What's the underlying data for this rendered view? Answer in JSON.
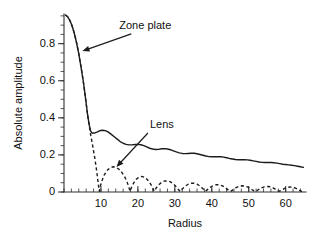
{
  "chart_data": {
    "type": "line",
    "title": "",
    "xlabel": "Radius",
    "ylabel": "Absolute amplitude",
    "xlim": [
      0,
      65.5
    ],
    "ylim": [
      0,
      0.96
    ],
    "grid": false,
    "legend": "annotations on plot",
    "x_ticks": [
      10,
      20,
      30,
      40,
      50,
      60
    ],
    "x_tick_labels": [
      "10",
      "20",
      "30",
      "40",
      "50",
      "60"
    ],
    "x_minor_tick_step": 2,
    "y_ticks": [
      0,
      0.2,
      0.4,
      0.6,
      0.8
    ],
    "y_tick_labels": [
      "0",
      "0.2",
      "0.4",
      "0.6",
      "0.8"
    ],
    "y_minor_tick_step": 0.05,
    "annotations": [
      {
        "text": "Zone plate",
        "x": 22.0,
        "y": 0.88,
        "arrow_to_x": 5.0,
        "arrow_to_y": 0.76
      },
      {
        "text": "Lens",
        "x": 26.5,
        "y": 0.345,
        "arrow_to_x": 14.2,
        "arrow_to_y": 0.135
      }
    ],
    "series": [
      {
        "name": "Zone plate",
        "style": "solid",
        "points": [
          [
            0.4,
            0.955
          ],
          [
            1.0,
            0.945
          ],
          [
            1.6,
            0.925
          ],
          [
            2.2,
            0.895
          ],
          [
            2.8,
            0.855
          ],
          [
            3.4,
            0.805
          ],
          [
            4.0,
            0.745
          ],
          [
            4.6,
            0.675
          ],
          [
            5.2,
            0.6
          ],
          [
            5.8,
            0.51
          ],
          [
            6.3,
            0.43
          ],
          [
            6.8,
            0.365
          ],
          [
            7.2,
            0.33
          ],
          [
            7.6,
            0.318
          ],
          [
            8.2,
            0.318
          ],
          [
            8.9,
            0.323
          ],
          [
            9.6,
            0.33
          ],
          [
            10.4,
            0.333
          ],
          [
            11.2,
            0.331
          ],
          [
            12.0,
            0.323
          ],
          [
            12.8,
            0.311
          ],
          [
            13.6,
            0.298
          ],
          [
            14.4,
            0.285
          ],
          [
            15.2,
            0.272
          ],
          [
            16.0,
            0.263
          ],
          [
            16.8,
            0.257
          ],
          [
            17.6,
            0.254
          ],
          [
            18.4,
            0.254
          ],
          [
            19.2,
            0.256
          ],
          [
            20.0,
            0.257
          ],
          [
            20.8,
            0.255
          ],
          [
            21.6,
            0.25
          ],
          [
            22.4,
            0.243
          ],
          [
            23.2,
            0.236
          ],
          [
            24.0,
            0.232
          ],
          [
            24.8,
            0.229
          ],
          [
            25.6,
            0.23
          ],
          [
            26.4,
            0.233
          ],
          [
            27.2,
            0.234
          ],
          [
            28.0,
            0.232
          ],
          [
            28.8,
            0.228
          ],
          [
            29.6,
            0.222
          ],
          [
            30.4,
            0.216
          ],
          [
            31.2,
            0.211
          ],
          [
            32.0,
            0.208
          ],
          [
            32.8,
            0.207
          ],
          [
            33.6,
            0.208
          ],
          [
            34.4,
            0.209
          ],
          [
            35.2,
            0.209
          ],
          [
            36.0,
            0.206
          ],
          [
            36.8,
            0.202
          ],
          [
            37.6,
            0.198
          ],
          [
            38.4,
            0.194
          ],
          [
            39.2,
            0.191
          ],
          [
            40.0,
            0.19
          ],
          [
            40.8,
            0.19
          ],
          [
            41.6,
            0.191
          ],
          [
            42.4,
            0.19
          ],
          [
            43.2,
            0.188
          ],
          [
            44.0,
            0.185
          ],
          [
            44.8,
            0.181
          ],
          [
            45.6,
            0.178
          ],
          [
            46.4,
            0.175
          ],
          [
            47.2,
            0.174
          ],
          [
            48.0,
            0.174
          ],
          [
            48.8,
            0.174
          ],
          [
            49.6,
            0.173
          ],
          [
            50.4,
            0.171
          ],
          [
            51.2,
            0.168
          ],
          [
            52.0,
            0.165
          ],
          [
            52.8,
            0.162
          ],
          [
            53.6,
            0.16
          ],
          [
            54.4,
            0.159
          ],
          [
            55.2,
            0.159
          ],
          [
            56.0,
            0.159
          ],
          [
            56.8,
            0.158
          ],
          [
            57.6,
            0.156
          ],
          [
            58.4,
            0.153
          ],
          [
            59.2,
            0.15
          ],
          [
            60.0,
            0.148
          ],
          [
            60.8,
            0.146
          ],
          [
            61.6,
            0.144
          ],
          [
            62.4,
            0.142
          ],
          [
            63.2,
            0.139
          ],
          [
            64.0,
            0.136
          ],
          [
            64.8,
            0.133
          ]
        ]
      },
      {
        "name": "Lens",
        "style": "dashed",
        "points": [
          [
            0.4,
            0.955
          ],
          [
            1.0,
            0.945
          ],
          [
            1.6,
            0.925
          ],
          [
            2.2,
            0.895
          ],
          [
            2.8,
            0.855
          ],
          [
            3.4,
            0.805
          ],
          [
            4.0,
            0.745
          ],
          [
            4.6,
            0.675
          ],
          [
            5.2,
            0.6
          ],
          [
            5.8,
            0.51
          ],
          [
            6.3,
            0.43
          ],
          [
            6.8,
            0.36
          ],
          [
            7.2,
            0.31
          ],
          [
            7.8,
            0.245
          ],
          [
            8.4,
            0.175
          ],
          [
            8.9,
            0.105
          ],
          [
            9.3,
            0.04
          ],
          [
            9.55,
            0.004
          ],
          [
            9.8,
            0.03
          ],
          [
            10.3,
            0.062
          ],
          [
            10.9,
            0.092
          ],
          [
            11.6,
            0.115
          ],
          [
            12.4,
            0.13
          ],
          [
            13.2,
            0.136
          ],
          [
            14.0,
            0.134
          ],
          [
            14.8,
            0.124
          ],
          [
            15.6,
            0.107
          ],
          [
            16.4,
            0.083
          ],
          [
            17.0,
            0.058
          ],
          [
            17.5,
            0.03
          ],
          [
            17.85,
            0.004
          ],
          [
            18.2,
            0.022
          ],
          [
            18.8,
            0.047
          ],
          [
            19.5,
            0.068
          ],
          [
            20.3,
            0.08
          ],
          [
            21.0,
            0.084
          ],
          [
            21.8,
            0.08
          ],
          [
            22.5,
            0.068
          ],
          [
            23.2,
            0.05
          ],
          [
            23.9,
            0.028
          ],
          [
            24.4,
            0.004
          ],
          [
            24.9,
            0.02
          ],
          [
            25.6,
            0.038
          ],
          [
            26.4,
            0.052
          ],
          [
            27.2,
            0.059
          ],
          [
            28.0,
            0.06
          ],
          [
            28.8,
            0.055
          ],
          [
            29.6,
            0.044
          ],
          [
            30.4,
            0.028
          ],
          [
            31.1,
            0.01
          ],
          [
            31.5,
            0.003
          ],
          [
            32.0,
            0.016
          ],
          [
            32.8,
            0.031
          ],
          [
            33.6,
            0.042
          ],
          [
            34.4,
            0.047
          ],
          [
            35.2,
            0.047
          ],
          [
            36.0,
            0.042
          ],
          [
            36.8,
            0.032
          ],
          [
            37.6,
            0.018
          ],
          [
            38.3,
            0.004
          ],
          [
            38.9,
            0.014
          ],
          [
            39.7,
            0.027
          ],
          [
            40.5,
            0.036
          ],
          [
            41.3,
            0.04
          ],
          [
            42.1,
            0.039
          ],
          [
            42.9,
            0.033
          ],
          [
            43.7,
            0.023
          ],
          [
            44.5,
            0.01
          ],
          [
            45.1,
            0.003
          ],
          [
            45.8,
            0.013
          ],
          [
            46.6,
            0.024
          ],
          [
            47.4,
            0.031
          ],
          [
            48.2,
            0.034
          ],
          [
            49.0,
            0.032
          ],
          [
            49.8,
            0.026
          ],
          [
            50.6,
            0.017
          ],
          [
            51.4,
            0.006
          ],
          [
            51.9,
            0.003
          ],
          [
            52.6,
            0.012
          ],
          [
            53.4,
            0.022
          ],
          [
            54.2,
            0.028
          ],
          [
            55.0,
            0.03
          ],
          [
            55.8,
            0.028
          ],
          [
            56.6,
            0.022
          ],
          [
            57.4,
            0.013
          ],
          [
            58.2,
            0.004
          ],
          [
            58.8,
            0.008
          ],
          [
            59.6,
            0.018
          ],
          [
            60.4,
            0.025
          ],
          [
            61.2,
            0.027
          ],
          [
            62.0,
            0.026
          ],
          [
            62.8,
            0.02
          ],
          [
            63.6,
            0.011
          ],
          [
            64.3,
            0.003
          ],
          [
            64.9,
            0.006
          ]
        ]
      }
    ]
  },
  "figure": {
    "background": "#ffffff",
    "ink_color": "#1c1c1c"
  }
}
